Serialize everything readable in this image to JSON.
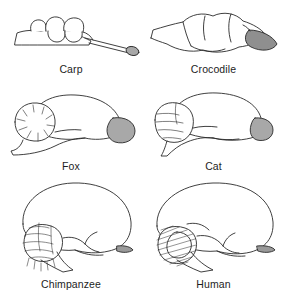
{
  "figure": {
    "background_color": "#ffffff",
    "outline_color": "#1a1a1a",
    "fill_color": "#ffffff",
    "highlight_fill_color": "#a8a8a8",
    "label_color": "#1d1d1d",
    "columns": 2,
    "rows": 3
  },
  "specimens": [
    {
      "label": "Carp",
      "icon": "carp-brain-icon",
      "row": 1,
      "column": 1,
      "highlight_region": "olfactory-bulb",
      "highlight_size": "small"
    },
    {
      "label": "Crocodile",
      "icon": "crocodile-brain-icon",
      "row": 1,
      "column": 2,
      "highlight_region": "olfactory-bulb",
      "highlight_size": "large-elongated"
    },
    {
      "label": "Fox",
      "icon": "fox-brain-icon",
      "row": 2,
      "column": 1,
      "highlight_region": "olfactory-bulb",
      "highlight_size": "large"
    },
    {
      "label": "Cat",
      "icon": "cat-brain-icon",
      "row": 2,
      "column": 2,
      "highlight_region": "olfactory-bulb",
      "highlight_size": "medium"
    },
    {
      "label": "Chimpanzee",
      "icon": "chimpanzee-brain-icon",
      "row": 3,
      "column": 1,
      "highlight_region": "olfactory-bulb",
      "highlight_size": "tiny"
    },
    {
      "label": "Human",
      "icon": "human-brain-icon",
      "row": 3,
      "column": 2,
      "highlight_region": "olfactory-bulb",
      "highlight_size": "tiny"
    }
  ],
  "cropped_caption": {
    "text": "",
    "legible": false
  }
}
